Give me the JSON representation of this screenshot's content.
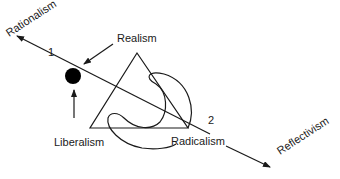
{
  "diagram": {
    "axis": {
      "start_label": "Rationalism",
      "end_label": "Reflectivism",
      "point_1": "1",
      "point_2": "2"
    },
    "labels": {
      "realism": "Realism",
      "liberalism": "Liberalism",
      "radicalism": "Radicalism"
    },
    "colors": {
      "stroke": "#1a1a1a",
      "background": "#ffffff",
      "dot": "#000000"
    }
  }
}
